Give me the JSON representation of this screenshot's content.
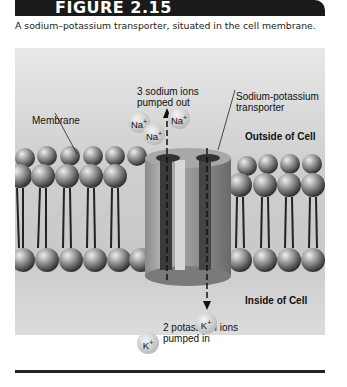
{
  "figure": {
    "number": "FIGURE 2.15",
    "caption": "A sodium–potassium transporter, situated in the cell membrane."
  },
  "labels": {
    "sodium_out": [
      "3 sodium ions",
      "pumped out"
    ],
    "transporter": [
      "Sodium-potassium",
      "transporter"
    ],
    "membrane": "Membrane",
    "outside": "Outside of Cell",
    "inside": "Inside of Cell",
    "potassium_in": [
      "2 potassium ions",
      "pumped in"
    ]
  },
  "ions": {
    "sodium": {
      "symbol": "Na",
      "charge": "+",
      "count": 3
    },
    "potassium": {
      "symbol": "K",
      "charge": "+",
      "count": 2
    }
  },
  "colors": {
    "banner": "#1a1a1a",
    "background": "#d2d2d2"
  }
}
